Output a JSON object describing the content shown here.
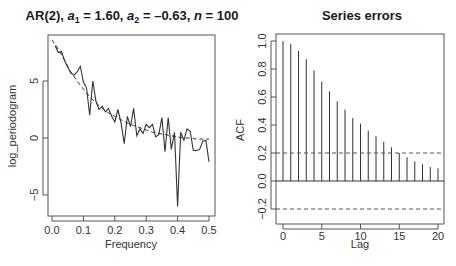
{
  "chart_data": [
    {
      "type": "line",
      "title": "AR(2), a1 = 1.60, a2 = -0.63, n = 100",
      "title_parts": {
        "prefix": "AR(2), ",
        "a1_label": "a",
        "a1_sub": "1",
        "a1_val": " = 1.60, ",
        "a2_label": "a",
        "a2_sub": "2",
        "a2_val": " = –0.63, ",
        "n_label": "n",
        "n_val": " = 100"
      },
      "xlabel": "Frequency",
      "ylabel": "log_periodogram",
      "xlim": [
        0.0,
        0.5
      ],
      "ylim": [
        -6.8,
        8.5
      ],
      "xticks": [
        "0.0",
        "0.1",
        "0.2",
        "0.3",
        "0.4",
        "0.5"
      ],
      "yticks": [
        "-5",
        "0",
        "5"
      ],
      "grid": false,
      "series": [
        {
          "name": "sample log periodogram",
          "style": "solid",
          "x": [
            0.01,
            0.02,
            0.03,
            0.04,
            0.05,
            0.06,
            0.07,
            0.08,
            0.09,
            0.1,
            0.11,
            0.12,
            0.13,
            0.14,
            0.15,
            0.16,
            0.17,
            0.18,
            0.19,
            0.2,
            0.21,
            0.22,
            0.23,
            0.24,
            0.25,
            0.26,
            0.27,
            0.28,
            0.29,
            0.3,
            0.31,
            0.32,
            0.33,
            0.34,
            0.35,
            0.36,
            0.37,
            0.38,
            0.39,
            0.4,
            0.41,
            0.42,
            0.43,
            0.44,
            0.45,
            0.46,
            0.47,
            0.48,
            0.49,
            0.5
          ],
          "values": [
            8.1,
            7.5,
            7.6,
            6.8,
            6.2,
            5.7,
            5.5,
            5.8,
            6.3,
            4.9,
            4.4,
            2.0,
            5.0,
            3.2,
            2.5,
            2.8,
            2.3,
            2.6,
            1.9,
            1.4,
            2.5,
            1.3,
            -0.5,
            1.9,
            1.0,
            2.6,
            0.2,
            0.8,
            0.4,
            1.2,
            0.9,
            1.2,
            0.1,
            0.3,
            1.8,
            -1.2,
            1.8,
            -1.0,
            0.5,
            -6.0,
            0.5,
            -0.2,
            0.8,
            0.6,
            -1.1,
            -1.1,
            -1.0,
            -0.3,
            -0.2,
            -2.1
          ]
        },
        {
          "name": "theoretical AR(2) log spectrum",
          "style": "dashed",
          "x": [
            0.0,
            0.02,
            0.04,
            0.06,
            0.08,
            0.1,
            0.12,
            0.14,
            0.16,
            0.18,
            0.2,
            0.22,
            0.24,
            0.26,
            0.28,
            0.3,
            0.32,
            0.34,
            0.36,
            0.38,
            0.4,
            0.42,
            0.44,
            0.46,
            0.48,
            0.5
          ],
          "values": [
            8.6,
            7.8,
            6.8,
            5.8,
            5.0,
            4.3,
            3.6,
            3.1,
            2.6,
            2.2,
            1.9,
            1.6,
            1.3,
            1.1,
            0.9,
            0.7,
            0.5,
            0.4,
            0.3,
            0.2,
            0.1,
            0.0,
            0.0,
            -0.1,
            -0.1,
            -0.1
          ]
        }
      ]
    },
    {
      "type": "bar",
      "title": "Series errors",
      "xlabel": "Lag",
      "ylabel": "ACF",
      "xlim": [
        0,
        20
      ],
      "ylim": [
        -0.24,
        1.0
      ],
      "xticks": [
        "0",
        "5",
        "10",
        "15",
        "20"
      ],
      "yticks": [
        "-0.2",
        "0.0",
        "0.2",
        "0.4",
        "0.6",
        "0.8",
        "1.0"
      ],
      "grid": false,
      "confidence_band": 0.2,
      "categories": [
        0,
        1,
        2,
        3,
        4,
        5,
        6,
        7,
        8,
        9,
        10,
        11,
        12,
        13,
        14,
        15,
        16,
        17,
        18,
        19,
        20
      ],
      "values": [
        1.0,
        0.98,
        0.93,
        0.87,
        0.79,
        0.71,
        0.64,
        0.57,
        0.51,
        0.45,
        0.41,
        0.36,
        0.32,
        0.28,
        0.24,
        0.2,
        0.17,
        0.14,
        0.12,
        0.1,
        0.09
      ]
    }
  ]
}
